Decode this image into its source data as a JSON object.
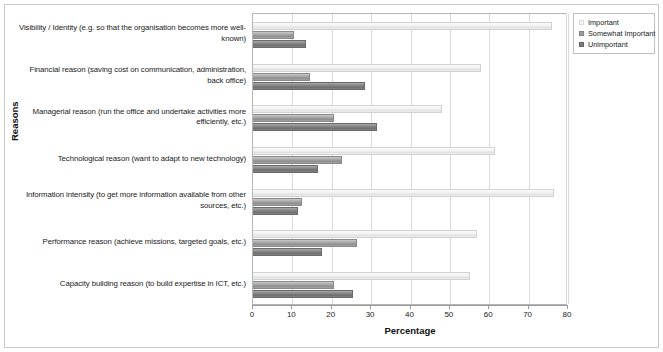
{
  "chart_data": {
    "type": "bar",
    "orientation": "horizontal",
    "title": "",
    "xlabel": "Percentage",
    "ylabel": "Reasons",
    "xlim": [
      0,
      80
    ],
    "xticks": [
      0,
      10,
      20,
      30,
      40,
      50,
      60,
      70,
      80
    ],
    "grid": true,
    "legend_position": "top-right",
    "categories": [
      "Visibility / Identity (e.g. so that the organisation becomes more well-known)",
      "Financial reason (saving cost on communication, administration, back office)",
      "Managerial reason (run the office and undertake activities more efficiently, etc.)",
      "Technological reason (want to adapt to new technology)",
      "Information intensity (to get more information available from other sources, etc.)",
      "Performance reason (achieve missions, targeted goals, etc.)",
      "Capacity building reason (to build expertise in ICT, etc.)"
    ],
    "series": [
      {
        "name": "Important",
        "color": "#f2f2f2",
        "values": [
          76.0,
          58.0,
          48.0,
          61.5,
          76.5,
          57.0,
          55.0
        ]
      },
      {
        "name": "Somewhat Important",
        "color": "#9b9b9b",
        "values": [
          10.5,
          14.5,
          20.5,
          22.5,
          12.5,
          26.5,
          20.5
        ]
      },
      {
        "name": "Unimportant",
        "color": "#7b7b7b",
        "values": [
          13.5,
          28.5,
          31.5,
          16.5,
          11.5,
          17.5,
          25.5
        ]
      }
    ]
  },
  "axes": {
    "x_title": "Percentage",
    "y_title": "Reasons",
    "x_tick_labels": [
      "0",
      "10",
      "20",
      "30",
      "40",
      "50",
      "60",
      "70",
      "80"
    ]
  },
  "legend": {
    "items": [
      {
        "label": "Important",
        "swatch": "legend-swatch-important"
      },
      {
        "label": "Somewhat Important",
        "swatch": "legend-swatch-somewhat-important"
      },
      {
        "label": "Unimportant",
        "swatch": "legend-swatch-unimportant"
      }
    ]
  }
}
